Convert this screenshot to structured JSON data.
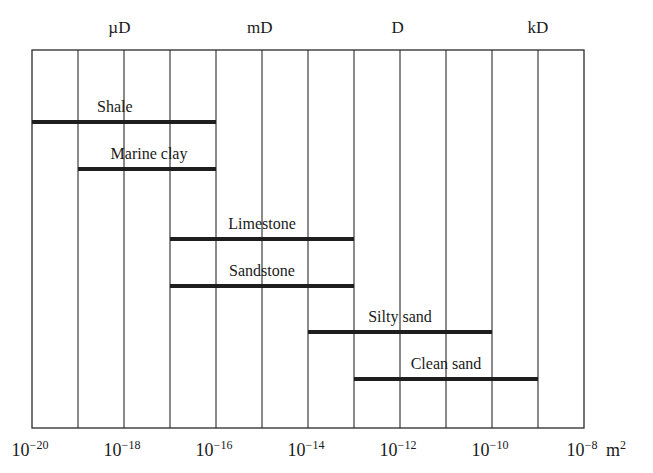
{
  "chart_data": {
    "type": "bar",
    "orientation": "horizontal-range",
    "title": "",
    "xlabel": "Permeability",
    "x_unit": "m2",
    "x_scale": "log10",
    "xlim": [
      -20,
      -8
    ],
    "grid": true,
    "grid_every_decade": true,
    "x_ticks": [
      {
        "exp": -20,
        "label_base": "10",
        "label_exp": "−20"
      },
      {
        "exp": -18,
        "label_base": "10",
        "label_exp": "−18"
      },
      {
        "exp": -16,
        "label_base": "10",
        "label_exp": "−16"
      },
      {
        "exp": -14,
        "label_base": "10",
        "label_exp": "−14"
      },
      {
        "exp": -12,
        "label_base": "10",
        "label_exp": "−12"
      },
      {
        "exp": -10,
        "label_base": "10",
        "label_exp": "−10"
      },
      {
        "exp": -8,
        "label_base": "10",
        "label_exp": "−8"
      }
    ],
    "unit_suffix": {
      "base": "m",
      "exp": "2"
    },
    "secondary_axis": [
      {
        "label": "µD",
        "x_exp": -18.1
      },
      {
        "label": "mD",
        "x_exp": -15.05
      },
      {
        "label": "D",
        "x_exp": -12.05
      },
      {
        "label": "kD",
        "x_exp": -9.0
      }
    ],
    "series": [
      {
        "name": "Shale",
        "start_exp": -20,
        "end_exp": -16
      },
      {
        "name": "Marine clay",
        "start_exp": -19,
        "end_exp": -16
      },
      {
        "name": "Limestone",
        "start_exp": -17,
        "end_exp": -13
      },
      {
        "name": "Sandstone",
        "start_exp": -17,
        "end_exp": -13
      },
      {
        "name": "Silty sand",
        "start_exp": -14,
        "end_exp": -10
      },
      {
        "name": "Clean sand",
        "start_exp": -13,
        "end_exp": -9
      }
    ]
  },
  "colors": {
    "line": "#2a2a2a",
    "bar": "#1e1e1e",
    "background": "#ffffff"
  }
}
